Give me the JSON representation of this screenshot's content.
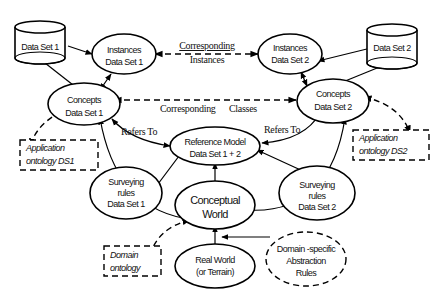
{
  "diagram": {
    "nodes": {
      "dataset1": {
        "label": "Data Set 1",
        "shape": "cylinder"
      },
      "dataset2": {
        "label": "Data Set 2",
        "shape": "cylinder"
      },
      "instances1": {
        "line1": "Instances",
        "line2": "Data Set 1",
        "shape": "ellipse"
      },
      "instances2": {
        "line1": "Instances",
        "line2": "Data Set 2",
        "shape": "ellipse"
      },
      "concepts1": {
        "line1": "Concepts",
        "line2": "Data Set 1",
        "shape": "ellipse"
      },
      "concepts2": {
        "line1": "Concepts",
        "line2": "Data Set  2",
        "shape": "ellipse"
      },
      "reference_model": {
        "line1": "Reference Model",
        "line2": "Data Set 1 + 2",
        "shape": "ellipse"
      },
      "surveying1": {
        "line1": "Surveying",
        "line2": "rules",
        "line3": "Data Set 1",
        "shape": "ellipse"
      },
      "surveying2": {
        "line1": "Surveying",
        "line2": "rules",
        "line3": "Data Set 2",
        "shape": "ellipse"
      },
      "conceptual_world": {
        "line1": "Conceptual",
        "line2": "World",
        "shape": "ellipse"
      },
      "real_world": {
        "line1": "Real World",
        "line2": "(or Terrain)",
        "shape": "ellipse"
      },
      "domain_rules": {
        "line1": "Domain  -specific",
        "line2": "Abstraction",
        "line3": "Rules",
        "shape": "dashed-ellipse"
      },
      "app_ontology1": {
        "line1": "Application",
        "line2": "ontology DS1",
        "shape": "dashed-box"
      },
      "app_ontology2": {
        "line1": "Application",
        "line2": "ontology DS2",
        "shape": "dashed-box"
      },
      "domain_ontology": {
        "line1": "Domain",
        "line2": "ontology",
        "shape": "dashed-box"
      }
    },
    "edge_labels": {
      "corr_instances_1": "Corresponding",
      "corr_instances_2": "Instances",
      "corr_classes_1": "Corresponding",
      "corr_classes_2": "Classes",
      "refers_to_left": "Refers To",
      "refers_to_right": "Refers To"
    },
    "edges": [
      {
        "from": "dataset1",
        "to": "instances1",
        "style": "solid"
      },
      {
        "from": "dataset1",
        "to": "concepts1",
        "style": "solid"
      },
      {
        "from": "dataset2",
        "to": "instances2",
        "style": "solid"
      },
      {
        "from": "dataset2",
        "to": "concepts2",
        "style": "solid"
      },
      {
        "from": "instances1",
        "to": "concepts1",
        "style": "solid-bidirectional"
      },
      {
        "from": "instances2",
        "to": "concepts2",
        "style": "solid-bidirectional"
      },
      {
        "from": "instances1",
        "to": "instances2",
        "style": "dashed-bidirectional",
        "label": "Corresponding Instances"
      },
      {
        "from": "concepts1",
        "to": "concepts2",
        "style": "dashed-bidirectional",
        "label": "Corresponding Classes"
      },
      {
        "from": "concepts1",
        "to": "reference_model",
        "style": "solid-bidirectional",
        "label": "Refers To"
      },
      {
        "from": "concepts2",
        "to": "reference_model",
        "style": "solid-bidirectional",
        "label": "Refers To"
      },
      {
        "from": "concepts1",
        "to": "app_ontology1",
        "style": "dashed-bidirectional"
      },
      {
        "from": "concepts2",
        "to": "app_ontology2",
        "style": "dashed-bidirectional"
      },
      {
        "from": "conceptual_world",
        "to": "reference_model",
        "style": "solid"
      },
      {
        "from": "surveying1",
        "to": "reference_model",
        "style": "solid"
      },
      {
        "from": "surveying2",
        "to": "reference_model",
        "style": "solid"
      },
      {
        "from": "conceptual_world",
        "to": "concepts1",
        "style": "solid"
      },
      {
        "from": "conceptual_world",
        "to": "concepts2",
        "style": "solid"
      },
      {
        "from": "real_world",
        "to": "conceptual_world",
        "style": "solid"
      },
      {
        "from": "domain_rules",
        "to": "conceptual_world",
        "style": "solid"
      },
      {
        "from": "conceptual_world",
        "to": "domain_ontology",
        "style": "dashed-bidirectional"
      }
    ]
  }
}
